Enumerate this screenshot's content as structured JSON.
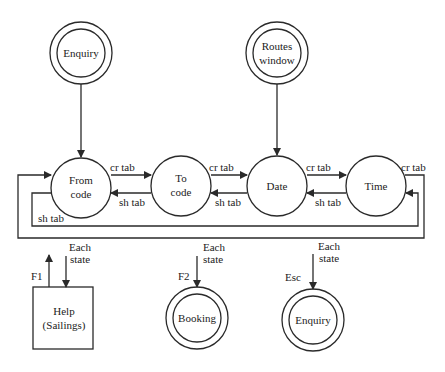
{
  "diagram": {
    "type": "state-transition-diagram",
    "colors": {
      "stroke": "#2a2a2a",
      "background": "#ffffff",
      "text": "#222222"
    },
    "entry_states": [
      {
        "id": "enquiry-top",
        "label": "Enquiry",
        "shape": "double-circle"
      },
      {
        "id": "routes-window",
        "label_line1": "Routes",
        "label_line2": "window",
        "shape": "double-circle"
      }
    ],
    "states": [
      {
        "id": "from-code",
        "label_line1": "From",
        "label_line2": "code",
        "shape": "circle"
      },
      {
        "id": "to-code",
        "label_line1": "To",
        "label_line2": "code",
        "shape": "circle"
      },
      {
        "id": "date",
        "label": "Date",
        "shape": "circle"
      },
      {
        "id": "time",
        "label": "Time",
        "shape": "circle"
      }
    ],
    "transitions": {
      "forward": "cr tab",
      "backward": "sh tab"
    },
    "exits": [
      {
        "id": "help",
        "key": "F1",
        "source_line1": "Each",
        "source_line2": "state",
        "label_line1": "Help",
        "label_line2": "(Sailings)",
        "shape": "box"
      },
      {
        "id": "booking",
        "key": "F2",
        "source_line1": "Each",
        "source_line2": "state",
        "label": "Booking",
        "shape": "double-circle"
      },
      {
        "id": "enquiry-bottom",
        "key": "Esc",
        "source_line1": "Each",
        "source_line2": "state",
        "label": "Enquiry",
        "shape": "double-circle"
      }
    ]
  }
}
